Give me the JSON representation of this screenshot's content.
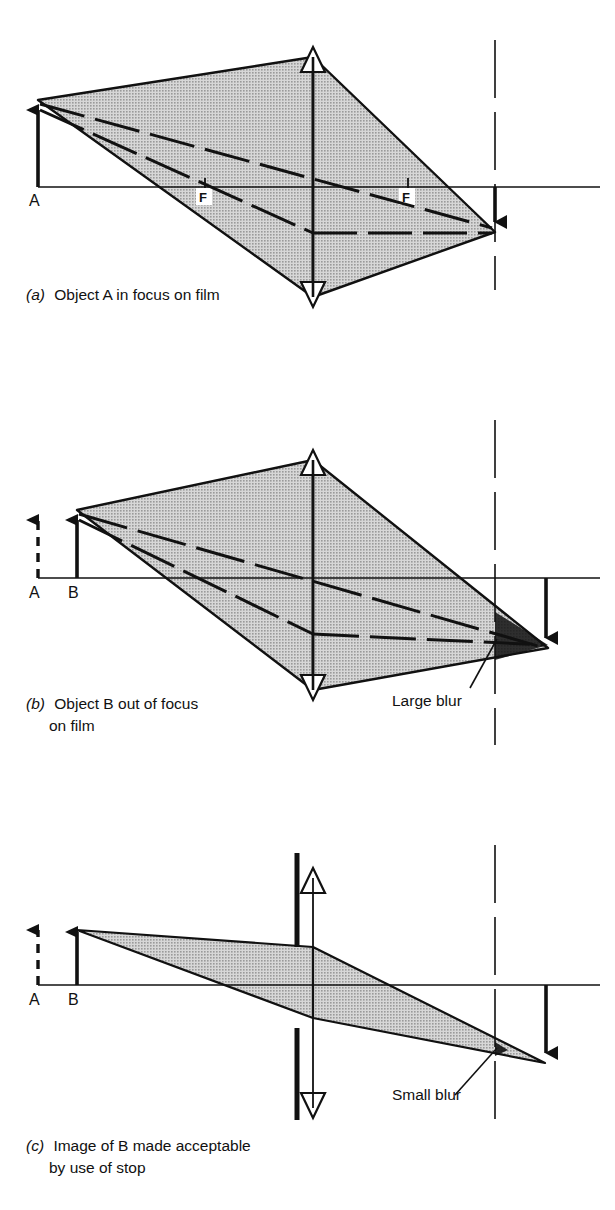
{
  "figure": {
    "type": "optics-ray-diagram",
    "topic": "Depth of field: focus, blur circle and effect of a lens stop",
    "background_color": "#ffffff",
    "ink_color": "#111111",
    "cone_fill_color": "#b9b9b9",
    "cone_edge_color": "#111111"
  },
  "panels": [
    {
      "id": "a",
      "letter": "(a)",
      "caption_lines": [
        "Object A in focus on film"
      ],
      "axis_label_left": "A",
      "focal_labels": [
        "F",
        "F"
      ],
      "objects": [
        {
          "name": "A",
          "style": "solid-arrow",
          "in_focus": true
        }
      ],
      "elements": [
        "optical-axis",
        "lens",
        "film-plane-dashed",
        "object-arrow-A",
        "image-arrow",
        "ray-cone-shaded",
        "chief-rays-dashed",
        "focal-point-ticks"
      ],
      "blur_label": null
    },
    {
      "id": "b",
      "letter": "(b)",
      "caption_lines": [
        "Object B out of focus",
        "on film"
      ],
      "axis_label_left": "A",
      "axis_label_second": "B",
      "focal_labels": [],
      "objects": [
        {
          "name": "A",
          "style": "dashed-arrow",
          "in_focus": false
        },
        {
          "name": "B",
          "style": "solid-arrow",
          "in_focus": false
        }
      ],
      "elements": [
        "optical-axis",
        "lens",
        "film-plane-dashed",
        "object-arrow-A-dashed",
        "object-arrow-B",
        "image-arrow",
        "ray-cone-shaded",
        "chief-rays-dashed",
        "blur-patch"
      ],
      "blur_label": "Large blur"
    },
    {
      "id": "c",
      "letter": "(c)",
      "caption_lines": [
        "Image of B made acceptable",
        "by use of stop"
      ],
      "axis_label_left": "A",
      "axis_label_second": "B",
      "focal_labels": [],
      "objects": [
        {
          "name": "A",
          "style": "dashed-arrow",
          "in_focus": false
        },
        {
          "name": "B",
          "style": "solid-arrow",
          "in_focus": false
        }
      ],
      "elements": [
        "optical-axis",
        "lens",
        "stop-bars",
        "film-plane-dashed",
        "object-arrow-A-dashed",
        "object-arrow-B",
        "image-arrow",
        "ray-cone-shaded-narrow",
        "blur-patch-small"
      ],
      "blur_label": "Small blur"
    }
  ],
  "labels": {
    "panel_a_caption_letter": "(a)",
    "panel_a_caption_text": "Object A in focus on film",
    "panel_b_caption_letter": "(b)",
    "panel_b_caption_text_line1": "Object B out of focus",
    "panel_b_caption_text_line2": "on film",
    "panel_c_caption_letter": "(c)",
    "panel_c_caption_text_line1": "Image of B made acceptable",
    "panel_c_caption_text_line2": "by use of stop",
    "large_blur": "Large blur",
    "small_blur": "Small blur",
    "object_a": "A",
    "object_b_panel_b": "B",
    "object_b_panel_c": "B",
    "object_a_panel_b": "A",
    "object_a_panel_c": "A",
    "focal_left": "F",
    "focal_right": "F"
  }
}
